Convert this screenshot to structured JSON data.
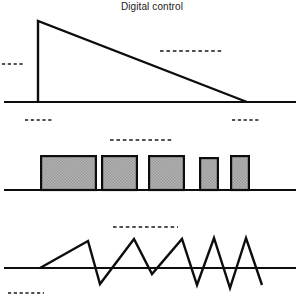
{
  "figure": {
    "title": "Digital control",
    "background_color": "#ffffff",
    "ink_color": "#0d0d0d",
    "pulse_fill_color": "#a8a8a8",
    "panel_count": 3
  },
  "panels": [
    {
      "name": "ramp-panel",
      "waveform_type": "sawtooth-ramp-decay",
      "baseline_y": 102,
      "baseline_x_start": 4,
      "baseline_x_end": 296,
      "description": "single rising edge followed by linear decay to baseline",
      "vertices": [
        {
          "x": 38,
          "y": 102
        },
        {
          "x": 38,
          "y": 21
        },
        {
          "x": 247,
          "y": 102
        }
      ],
      "annotations": [
        {
          "name": "left-level-dash",
          "x1": 2,
          "x2": 25,
          "y": 64
        },
        {
          "name": "right-level-dash",
          "x1": 160,
          "x2": 224,
          "y": 51
        },
        {
          "name": "below-left-dash",
          "x1": 25,
          "x2": 52,
          "y": 120
        },
        {
          "name": "below-right-dash",
          "x1": 232,
          "x2": 259,
          "y": 120
        }
      ]
    },
    {
      "name": "pulse-panel",
      "waveform_type": "pwm-pulse-train",
      "baseline_y": 190,
      "baseline_x_start": 4,
      "baseline_x_end": 296,
      "description": "five rectangular pulses of decreasing width",
      "pulses": [
        {
          "index": 1,
          "x": 40,
          "width": 57,
          "top_y": 155
        },
        {
          "index": 2,
          "x": 101,
          "width": 37,
          "top_y": 155
        },
        {
          "index": 3,
          "x": 148,
          "width": 37,
          "top_y": 155
        },
        {
          "index": 4,
          "x": 199,
          "width": 20,
          "top_y": 157
        },
        {
          "index": 5,
          "x": 230,
          "width": 20,
          "top_y": 155
        }
      ],
      "annotations": [
        {
          "name": "pulse-level-dash",
          "x1": 110,
          "x2": 174,
          "y": 140
        }
      ]
    },
    {
      "name": "sawtooth-panel",
      "waveform_type": "sawtooth-increasing-frequency",
      "baseline_y": 268,
      "baseline_x_start": 4,
      "baseline_x_end": 296,
      "description": "sawtooth oscillation with rising frequency and amplitude about the baseline",
      "vertices": [
        {
          "x": 40,
          "y": 268
        },
        {
          "x": 88,
          "y": 241
        },
        {
          "x": 100,
          "y": 284
        },
        {
          "x": 134,
          "y": 239
        },
        {
          "x": 152,
          "y": 274
        },
        {
          "x": 182,
          "y": 239
        },
        {
          "x": 197,
          "y": 285
        },
        {
          "x": 214,
          "y": 238
        },
        {
          "x": 230,
          "y": 288
        },
        {
          "x": 246,
          "y": 238
        },
        {
          "x": 262,
          "y": 285
        }
      ],
      "annotations": [
        {
          "name": "sawtooth-level-dash",
          "x1": 113,
          "x2": 178,
          "y": 227
        },
        {
          "name": "bottom-left-dash",
          "x1": 8,
          "x2": 44,
          "y": 293
        }
      ]
    }
  ]
}
